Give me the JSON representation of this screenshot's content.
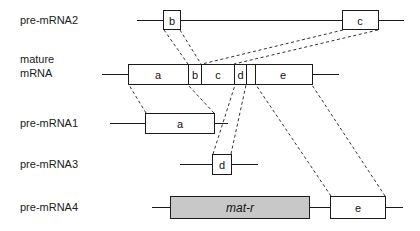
{
  "figure": {
    "type": "gene-structure-diagram",
    "background_color": "#ffffff",
    "line_color": "#1a1a1a",
    "connector_color": "#333333",
    "filled_box_color": "#c8c8c8"
  },
  "rows": [
    {
      "id": "pre-mrna2",
      "label": "pre-mRNA2",
      "segments": [
        {
          "name": "b",
          "label": "b",
          "filled": false
        },
        {
          "name": "c",
          "label": "c",
          "filled": false
        }
      ]
    },
    {
      "id": "mature-mrna",
      "label_line1": "mature",
      "label_line2": "mRNA",
      "segments": [
        {
          "name": "a",
          "label": "a",
          "filled": false
        },
        {
          "name": "b",
          "label": "b",
          "filled": false
        },
        {
          "name": "c",
          "label": "c",
          "filled": false
        },
        {
          "name": "d",
          "label": "d",
          "filled": false
        },
        {
          "name": "e",
          "label": "e",
          "filled": false
        }
      ]
    },
    {
      "id": "pre-mrna1",
      "label": "pre-mRNA1",
      "segments": [
        {
          "name": "a",
          "label": "a",
          "filled": false
        }
      ]
    },
    {
      "id": "pre-mrna3",
      "label": "pre-mRNA3",
      "segments": [
        {
          "name": "d",
          "label": "d",
          "filled": false
        }
      ]
    },
    {
      "id": "pre-mrna4",
      "label": "pre-mRNA4",
      "segments": [
        {
          "name": "mat-r",
          "label": "mat-r",
          "filled": true,
          "italic": true
        },
        {
          "name": "e",
          "label": "e",
          "filled": false
        }
      ]
    }
  ],
  "labels": {
    "pre_mrna2": "pre-mRNA2",
    "mature_line1": "mature",
    "mature_line2": "mRNA",
    "pre_mrna1": "pre-mRNA1",
    "pre_mrna3": "pre-mRNA3",
    "pre_mrna4": "pre-mRNA4",
    "seg_a": "a",
    "seg_b": "b",
    "seg_c": "c",
    "seg_d": "d",
    "seg_e": "e",
    "seg_b2": "b",
    "seg_c2": "c",
    "seg_a1": "a",
    "seg_d3": "d",
    "seg_matr": "mat-r",
    "seg_e4": "e"
  }
}
